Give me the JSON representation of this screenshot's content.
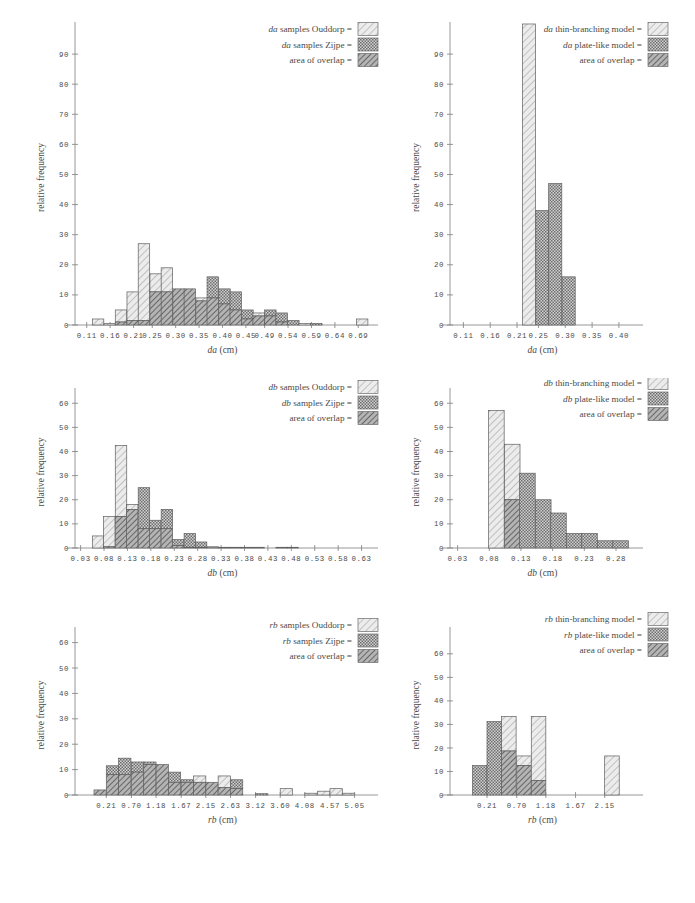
{
  "figure": {
    "title": "",
    "panel_count": 6
  },
  "common": {
    "ylabel": "relative  frequency",
    "unit": "(cm)",
    "legend_equals": "="
  },
  "chart_data": [
    {
      "id": "da-samples",
      "type": "bar",
      "title": "",
      "xlabel": "da (cm)",
      "xlabel_italic": "da",
      "ylabel": "relative  frequency",
      "ylim": [
        0,
        98
      ],
      "yticks": [
        0,
        10,
        20,
        30,
        40,
        50,
        60,
        70,
        80,
        90
      ],
      "xticks": [
        "0.11",
        "0.16",
        "0.21",
        "0.25",
        "0.30",
        "0.35",
        "0.40",
        "0.45",
        "0.49",
        "0.54",
        "0.59",
        "0.64",
        "0.69"
      ],
      "xlim": [
        0.085,
        0.715
      ],
      "bin_width": 0.0245,
      "legend": [
        {
          "label_italic": "da",
          "label": "samples Ouddorp =",
          "swatch": "light-hatch"
        },
        {
          "label_italic": "da",
          "label": "samples Zijpe =",
          "swatch": "dot-gray"
        },
        {
          "label_italic": "",
          "label": "area of overlap =",
          "swatch": "dark-hatch"
        }
      ],
      "series": [
        {
          "name": "samples Ouddorp",
          "swatch": "light-hatch",
          "bins": [
            0.098,
            0.122,
            0.147,
            0.171,
            0.196,
            0.22,
            0.245,
            0.269,
            0.294,
            0.318,
            0.343,
            0.367,
            0.392,
            0.416,
            0.441,
            0.465,
            0.49,
            0.514,
            0.539,
            0.563,
            0.588,
            0.612,
            0.637,
            0.661,
            0.686
          ],
          "values": [
            0,
            2,
            0.5,
            5,
            11,
            27,
            17,
            19,
            12,
            12,
            9,
            9,
            7,
            5,
            2,
            4,
            3,
            1,
            0,
            0.5,
            0,
            0,
            0,
            0,
            2
          ]
        },
        {
          "name": "samples Zijpe",
          "swatch": "dot-gray",
          "bins": [
            0.098,
            0.122,
            0.147,
            0.171,
            0.196,
            0.22,
            0.245,
            0.269,
            0.294,
            0.318,
            0.343,
            0.367,
            0.392,
            0.416,
            0.441,
            0.465,
            0.49,
            0.514,
            0.539,
            0.563,
            0.588,
            0.612,
            0.637,
            0.661,
            0.686
          ],
          "values": [
            0,
            0,
            0,
            1,
            1.5,
            1.5,
            11,
            11,
            12,
            12,
            8,
            16,
            12,
            11,
            5,
            3,
            5,
            4,
            1.5,
            0,
            0.5,
            0,
            0,
            0,
            0
          ]
        }
      ]
    },
    {
      "id": "da-models",
      "type": "bar",
      "title": "",
      "xlabel": "da (cm)",
      "xlabel_italic": "da",
      "ylabel": "relative  frequency",
      "ylim": [
        0,
        98
      ],
      "yticks": [
        0,
        10,
        20,
        30,
        40,
        50,
        60,
        70,
        80,
        90
      ],
      "xticks": [
        "0.11",
        "0.16",
        "0.21",
        "0.25",
        "0.30",
        "0.35",
        "0.40"
      ],
      "xlim": [
        0.085,
        0.43
      ],
      "bin_width": 0.0245,
      "legend": [
        {
          "label_italic": "da",
          "label": "thin-branching model =",
          "swatch": "light-hatch"
        },
        {
          "label_italic": "da",
          "label": "plate-like model =",
          "swatch": "dot-gray"
        },
        {
          "label_italic": "",
          "label": "area of overlap =",
          "swatch": "dark-hatch"
        }
      ],
      "series": [
        {
          "name": "thin-branching model",
          "swatch": "light-hatch",
          "bins": [
            0.22,
            0.245,
            0.269,
            0.294
          ],
          "values": [
            100,
            0,
            0,
            0
          ]
        },
        {
          "name": "plate-like model",
          "swatch": "dot-gray",
          "bins": [
            0.22,
            0.245,
            0.269,
            0.294
          ],
          "values": [
            0,
            38,
            47,
            16
          ]
        }
      ]
    },
    {
      "id": "db-samples",
      "type": "bar",
      "title": "",
      "xlabel": "db (cm)",
      "xlabel_italic": "db",
      "ylabel": "relative  frequency",
      "ylim": [
        0,
        63
      ],
      "yticks": [
        0,
        10,
        20,
        30,
        40,
        50,
        60
      ],
      "xticks": [
        "0.03",
        "0.08",
        "0.13",
        "0.18",
        "0.23",
        "0.28",
        "0.33",
        "0.38",
        "0.43",
        "0.48",
        "0.53",
        "0.58",
        "0.63"
      ],
      "xlim": [
        0.018,
        0.648
      ],
      "bin_width": 0.0245,
      "legend": [
        {
          "label_italic": "db",
          "label": "samples Ouddorp =",
          "swatch": "light-hatch"
        },
        {
          "label_italic": "db",
          "label": "samples Zijpe =",
          "swatch": "dot-gray"
        },
        {
          "label_italic": "",
          "label": "area of overlap =",
          "swatch": "dark-hatch"
        }
      ],
      "series": [
        {
          "name": "samples Ouddorp",
          "swatch": "light-hatch",
          "bins": [
            0.03,
            0.055,
            0.079,
            0.104,
            0.128,
            0.153,
            0.177,
            0.202,
            0.226,
            0.251,
            0.275,
            0.3,
            0.324,
            0.349,
            0.373,
            0.398,
            0.422,
            0.447,
            0.471,
            0.496,
            0.52,
            0.545,
            0.569,
            0.594,
            0.618
          ],
          "values": [
            0,
            5,
            13,
            42.5,
            18,
            8,
            8,
            8,
            1,
            0.3,
            0.3,
            0,
            0.3,
            0.3,
            0.3,
            0.3,
            0,
            0.3,
            0.3,
            0,
            0,
            0,
            0,
            0,
            0
          ]
        },
        {
          "name": "samples Zijpe",
          "swatch": "dot-gray",
          "bins": [
            0.03,
            0.055,
            0.079,
            0.104,
            0.128,
            0.153,
            0.177,
            0.202,
            0.226,
            0.251,
            0.275,
            0.3,
            0.324,
            0.349,
            0.373,
            0.398,
            0.422,
            0.447,
            0.471,
            0.496,
            0.52,
            0.545,
            0.569,
            0.594,
            0.618
          ],
          "values": [
            0,
            0,
            0.5,
            13,
            16,
            25,
            11.5,
            16,
            3.5,
            6,
            2.5,
            0.5,
            0.3,
            0,
            0,
            0,
            0,
            0,
            0,
            0,
            0,
            0,
            0,
            0,
            0
          ]
        }
      ]
    },
    {
      "id": "db-models",
      "type": "bar",
      "title": "",
      "xlabel": "db (cm)",
      "xlabel_italic": "db",
      "ylabel": "relative  frequency",
      "ylim": [
        0,
        63
      ],
      "yticks": [
        0,
        10,
        20,
        30,
        40,
        50,
        60
      ],
      "xticks": [
        "0.03",
        "0.08",
        "0.13",
        "0.18",
        "0.23",
        "0.28"
      ],
      "xlim": [
        0.018,
        0.31
      ],
      "bin_width": 0.0245,
      "legend": [
        {
          "label_italic": "db",
          "label": "thin-branching model =",
          "swatch": "light-hatch"
        },
        {
          "label_italic": "db",
          "label": "plate-like model =",
          "swatch": "dot-gray"
        },
        {
          "label_italic": "",
          "label": "area of overlap =",
          "swatch": "dark-hatch"
        }
      ],
      "series": [
        {
          "name": "thin-branching model",
          "swatch": "light-hatch",
          "bins": [
            0.079,
            0.104,
            0.128,
            0.153,
            0.177,
            0.202,
            0.226,
            0.251,
            0.275
          ],
          "values": [
            57,
            43,
            0,
            0,
            0,
            0,
            0,
            0,
            0
          ]
        },
        {
          "name": "plate-like model",
          "swatch": "dot-gray",
          "bins": [
            0.079,
            0.104,
            0.128,
            0.153,
            0.177,
            0.202,
            0.226,
            0.251,
            0.275
          ],
          "values": [
            0,
            20,
            31,
            20,
            14.5,
            6,
            6,
            3,
            3
          ]
        }
      ]
    },
    {
      "id": "rb-samples",
      "type": "bar",
      "title": "",
      "xlabel": "rb (cm)",
      "xlabel_italic": "rb",
      "ylabel": "relative  frequency",
      "ylim": [
        0,
        63
      ],
      "yticks": [
        0,
        10,
        20,
        30,
        40,
        50,
        60
      ],
      "xticks": [
        "0.21",
        "0.70",
        "1.18",
        "1.67",
        "2.15",
        "2.63",
        "3.12",
        "3.60",
        "4.08",
        "4.57",
        "5.05"
      ],
      "xlim": [
        -0.4,
        5.35
      ],
      "bin_width": 0.24,
      "legend": [
        {
          "label_italic": "rb",
          "label": "samples Ouddorp =",
          "swatch": "light-hatch"
        },
        {
          "label_italic": "rb",
          "label": "samples Zijpe =",
          "swatch": "dot-gray"
        },
        {
          "label_italic": "",
          "label": "area of overlap =",
          "swatch": "dark-hatch"
        }
      ],
      "series": [
        {
          "name": "samples Ouddorp",
          "swatch": "light-hatch",
          "bins": [
            -0.03,
            0.21,
            0.45,
            0.7,
            0.94,
            1.18,
            1.42,
            1.67,
            1.91,
            2.15,
            2.39,
            2.63,
            2.88,
            3.12,
            3.36,
            3.6,
            3.84,
            4.08,
            4.33,
            4.57,
            4.81,
            5.05
          ],
          "values": [
            2,
            8,
            8,
            9,
            12,
            12,
            5,
            5,
            7.5,
            5,
            7.5,
            2.5,
            0,
            0,
            0,
            2.5,
            0,
            0.7,
            1.5,
            2.5,
            0.7,
            0
          ]
        },
        {
          "name": "samples Zijpe",
          "swatch": "dot-gray",
          "bins": [
            -0.03,
            0.21,
            0.45,
            0.7,
            0.94,
            1.18,
            1.42,
            1.67,
            1.91,
            2.15,
            2.39,
            2.63,
            2.88,
            3.12,
            3.36,
            3.6,
            3.84,
            4.08,
            4.33,
            4.57,
            4.81,
            5.05
          ],
          "values": [
            2,
            11.5,
            14.5,
            13,
            13,
            12,
            9,
            6,
            5,
            5,
            3,
            6,
            0,
            0.5,
            0,
            0,
            0,
            0,
            0,
            0,
            0,
            0
          ]
        }
      ]
    },
    {
      "id": "rb-models",
      "type": "bar",
      "title": "",
      "xlabel": "rb (cm)",
      "xlabel_italic": "rb",
      "ylabel": "relative  frequency",
      "ylim": [
        0,
        68
      ],
      "yticks": [
        0,
        10,
        20,
        30,
        40,
        50,
        60
      ],
      "xticks": [
        "0.21",
        "0.70",
        "1.18",
        "1.67",
        "2.15"
      ],
      "xlim": [
        -0.4,
        2.65
      ],
      "bin_width": 0.24,
      "legend": [
        {
          "label_italic": "rb",
          "label": "thin-branching model =",
          "swatch": "light-hatch"
        },
        {
          "label_italic": "rb",
          "label": "plate-like model =",
          "swatch": "dot-gray"
        },
        {
          "label_italic": "",
          "label": "area of overlap =",
          "swatch": "dark-hatch"
        }
      ],
      "series": [
        {
          "name": "thin-branching model",
          "swatch": "light-hatch",
          "bins": [
            -0.03,
            0.21,
            0.45,
            0.7,
            0.94,
            1.18,
            1.42,
            1.67,
            1.91,
            2.15
          ],
          "values": [
            0,
            0,
            33.3,
            16.6,
            33.3,
            0,
            0,
            0,
            0,
            16.6
          ]
        },
        {
          "name": "plate-like model",
          "swatch": "dot-gray",
          "bins": [
            -0.03,
            0.21,
            0.45,
            0.7,
            0.94,
            1.18,
            1.42,
            1.67,
            1.91,
            2.15
          ],
          "values": [
            12.5,
            31.2,
            18.7,
            12.5,
            6.2,
            0,
            0,
            0,
            0,
            0
          ]
        }
      ]
    }
  ],
  "colors": {
    "light_hatch": "#d8d8d8",
    "dot_gray": "#9a9a9a",
    "dark_hatch": "#707070",
    "axis": "#7d7d7d",
    "text": "#4a4a4a"
  }
}
